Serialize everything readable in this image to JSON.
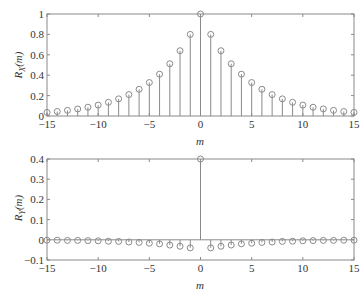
{
  "chart_data": [
    {
      "type": "stem",
      "title": "",
      "xlabel": "m",
      "ylabel": "R_X(m)",
      "ylabel_main": "R",
      "ylabel_sub": "X",
      "ylabel_arg": "(m)",
      "xlim": [
        -15,
        15
      ],
      "ylim": [
        0,
        1
      ],
      "xticks": [
        -15,
        -10,
        -5,
        0,
        5,
        10,
        15
      ],
      "xtick_labels": [
        "−15",
        "−10",
        "−5",
        "0",
        "5",
        "10",
        "15"
      ],
      "yticks": [
        0,
        0.2,
        0.4,
        0.6,
        0.8,
        1
      ],
      "ytick_labels": [
        "0",
        "0.2",
        "0.4",
        "0.6",
        "0.8",
        "1"
      ],
      "x": [
        -15,
        -14,
        -13,
        -12,
        -11,
        -10,
        -9,
        -8,
        -7,
        -6,
        -5,
        -4,
        -3,
        -2,
        -1,
        0,
        1,
        2,
        3,
        4,
        5,
        6,
        7,
        8,
        9,
        10,
        11,
        12,
        13,
        14,
        15
      ],
      "y": [
        0.035,
        0.044,
        0.055,
        0.069,
        0.086,
        0.107,
        0.134,
        0.168,
        0.21,
        0.262,
        0.328,
        0.41,
        0.512,
        0.64,
        0.8,
        1.0,
        0.8,
        0.64,
        0.512,
        0.41,
        0.328,
        0.262,
        0.21,
        0.168,
        0.134,
        0.107,
        0.086,
        0.069,
        0.055,
        0.044,
        0.035
      ],
      "grid": false
    },
    {
      "type": "stem",
      "title": "",
      "xlabel": "m",
      "ylabel": "R_Y(m)",
      "ylabel_main": "R",
      "ylabel_sub": "Y",
      "ylabel_arg": "(m)",
      "xlim": [
        -15,
        15
      ],
      "ylim": [
        -0.1,
        0.4
      ],
      "xticks": [
        -15,
        -10,
        -5,
        0,
        5,
        10,
        15
      ],
      "xtick_labels": [
        "−15",
        "−10",
        "−5",
        "0",
        "5",
        "10",
        "15"
      ],
      "yticks": [
        -0.1,
        0,
        0.1,
        0.2,
        0.3,
        0.4
      ],
      "ytick_labels": [
        "−0.1",
        "0",
        "0.1",
        "0.2",
        "0.3",
        "0.4"
      ],
      "x": [
        -15,
        -14,
        -13,
        -12,
        -11,
        -10,
        -9,
        -8,
        -7,
        -6,
        -5,
        -4,
        -3,
        -2,
        -1,
        0,
        1,
        2,
        3,
        4,
        5,
        6,
        7,
        8,
        9,
        10,
        11,
        12,
        13,
        14,
        15
      ],
      "y": [
        -0.002,
        -0.002,
        -0.003,
        -0.003,
        -0.004,
        -0.005,
        -0.007,
        -0.008,
        -0.011,
        -0.013,
        -0.017,
        -0.02,
        -0.026,
        -0.032,
        -0.04,
        0.4,
        -0.04,
        -0.032,
        -0.026,
        -0.02,
        -0.017,
        -0.013,
        -0.011,
        -0.008,
        -0.007,
        -0.005,
        -0.004,
        -0.003,
        -0.003,
        -0.002,
        -0.002
      ],
      "grid": false
    }
  ]
}
